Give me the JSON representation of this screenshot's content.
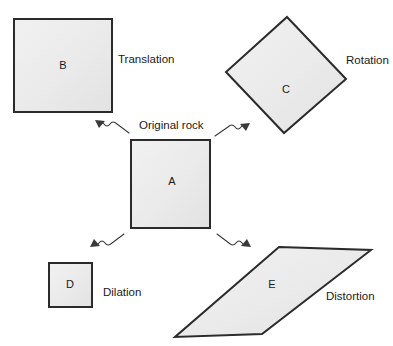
{
  "diagram": {
    "background_color": "#ffffff",
    "shape_fill_color": "#ececec",
    "shape_stroke_color": "#2b2b2b",
    "text_color": "#1a1a1a",
    "arrow_color": "#3a3a3a",
    "shapes": [
      {
        "id": "shape-b",
        "letter": "B",
        "kind": "square",
        "label_x": 63,
        "label_y": 66,
        "points": "14,19 112,19 112,112 14,112"
      },
      {
        "id": "shape-c",
        "letter": "C",
        "kind": "diamond",
        "label_x": 286,
        "label_y": 90,
        "points": "287,17 346,79 284,133 226,72"
      },
      {
        "id": "shape-a",
        "letter": "A",
        "kind": "square",
        "label_x": 172,
        "label_y": 182,
        "points": "131,140 210,140 210,228 131,228"
      },
      {
        "id": "shape-d",
        "letter": "D",
        "kind": "square",
        "label_x": 70,
        "label_y": 285,
        "points": "49,263 92,263 92,307 49,307"
      },
      {
        "id": "shape-e",
        "letter": "E",
        "kind": "parallelogram",
        "label_x": 272,
        "label_y": 285,
        "points": "279,247 371,250 262,334 175,337"
      }
    ],
    "captions": [
      {
        "id": "caption-translation",
        "text": "Translation",
        "x": 118,
        "y": 60
      },
      {
        "id": "caption-rotation",
        "text": "Rotation",
        "x": 346,
        "y": 61
      },
      {
        "id": "caption-original-rock",
        "text": "Original rock",
        "x": 139,
        "y": 126
      },
      {
        "id": "caption-dilation",
        "text": "Dilation",
        "x": 103,
        "y": 293
      },
      {
        "id": "caption-distortion",
        "text": "Distortion",
        "x": 326,
        "y": 297
      }
    ],
    "arrows": [
      {
        "id": "arrow-a-to-b",
        "from": "A",
        "to": "B",
        "transformation": "Translation",
        "path": "M 129,133 L 117,124 Q 113,120 110,124 Q 107,128 104,124 Q 101,120 98,122",
        "head_points": "95,120 105,121 99,128"
      },
      {
        "id": "arrow-a-to-c",
        "from": "A",
        "to": "C",
        "transformation": "Rotation",
        "path": "M 215,136 L 228,127 Q 232,123 235,127 Q 238,131 241,127 Q 244,123 247,125",
        "head_points": "250,123 240,124 246,131"
      },
      {
        "id": "arrow-a-to-d",
        "from": "A",
        "to": "D",
        "transformation": "Dilation",
        "path": "M 124,234 L 112,243 Q 108,247 105,243 Q 102,239 99,243 Q 96,247 93,245",
        "head_points": "90,247 100,246 94,239"
      },
      {
        "id": "arrow-a-to-e",
        "from": "A",
        "to": "E",
        "transformation": "Distortion",
        "path": "M 217,234 L 229,243 Q 233,247 236,243 Q 239,239 242,243 Q 245,247 248,245",
        "head_points": "251,247 241,246 247,239"
      }
    ]
  }
}
